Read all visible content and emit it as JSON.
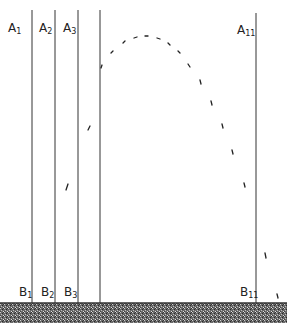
{
  "diagram": {
    "top_labels": [
      {
        "text": "A",
        "sub": "1",
        "x": 8
      },
      {
        "text": "A",
        "sub": "2",
        "x": 40
      },
      {
        "text": "A",
        "sub": "3",
        "x": 63
      },
      {
        "text": "A",
        "sub": "11",
        "x": 232
      }
    ],
    "bottom_labels": [
      {
        "text": "B",
        "sub": "1",
        "x": 20
      },
      {
        "text": "B",
        "sub": "2",
        "x": 42
      },
      {
        "text": "B",
        "sub": "3",
        "x": 65
      },
      {
        "text": "B",
        "sub": "11",
        "x": 241
      }
    ],
    "line_color": "#333333",
    "ground_color": "#555555"
  }
}
